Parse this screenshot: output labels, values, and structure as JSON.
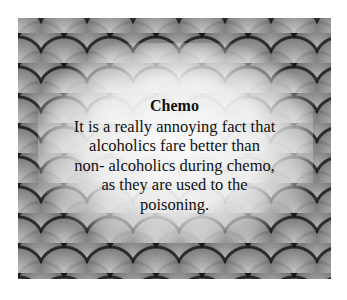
{
  "card": {
    "title": "Chemo",
    "lines": [
      "It is a really annoying fact that",
      "alcoholics fare better than",
      "non- alcoholics during chemo,",
      "as they are used to the",
      "poisoning."
    ],
    "background": "grey-fish-scale-pattern"
  }
}
